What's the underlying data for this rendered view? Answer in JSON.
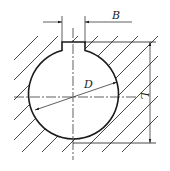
{
  "diagram": {
    "colors": {
      "stroke": "#1a1a1a",
      "hatch": "#333333",
      "background": "#ffffff"
    },
    "dimensions": {
      "B": {
        "label": "B",
        "meaning": "keyway width"
      },
      "D": {
        "label": "D",
        "meaning": "bore diameter"
      },
      "L": {
        "label": "L",
        "meaning": "depth from keyway top to bore bottom"
      }
    },
    "features": [
      "circular bore",
      "rectangular keyway at top",
      "hatched material section",
      "centerlines"
    ]
  }
}
